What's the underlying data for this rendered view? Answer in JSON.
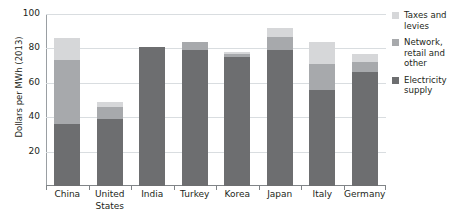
{
  "chart_data": {
    "type": "bar",
    "stacked": true,
    "title": "",
    "xlabel": "",
    "ylabel": "Dollars per MWh (2013)",
    "ylim": [
      0,
      100
    ],
    "yticks": [
      20,
      40,
      60,
      80,
      100
    ],
    "grid": "horizontal",
    "legend_position": "right",
    "categories": [
      "China",
      "United States",
      "India",
      "Turkey",
      "Korea",
      "Japan",
      "Italy",
      "Germany"
    ],
    "series": [
      {
        "name": "Electricity supply",
        "color": "#6d6e70",
        "values": [
          36,
          39,
          81,
          79,
          75,
          79,
          56,
          66
        ]
      },
      {
        "name": "Network, retail and other",
        "color": "#a7a9ac",
        "values": [
          37,
          7,
          0,
          5,
          2,
          7.5,
          15,
          6
        ]
      },
      {
        "name": "Taxes and levies",
        "color": "#d6d7d9",
        "values": [
          13,
          3,
          0,
          0,
          1,
          5.5,
          13,
          5
        ]
      }
    ],
    "totals": [
      86,
      49,
      81,
      84,
      78,
      92,
      84,
      77
    ]
  },
  "legend": {
    "items": [
      {
        "label": "Taxes and levies",
        "color": "#d6d7d9"
      },
      {
        "label": "Network, retail and other",
        "color": "#a7a9ac"
      },
      {
        "label": "Electricity supply",
        "color": "#6d6e70"
      }
    ]
  },
  "axis": {
    "y_title": "Dollars per MWh (2013)",
    "y_tick_labels": [
      "100",
      "80",
      "60",
      "40",
      "20"
    ],
    "x_tick_labels": [
      "China",
      "United States",
      "India",
      "Turkey",
      "Korea",
      "Japan",
      "Italy",
      "Germany"
    ]
  }
}
